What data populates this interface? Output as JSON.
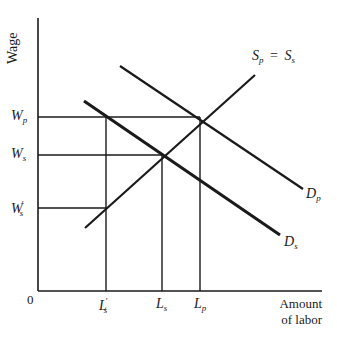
{
  "diagram": {
    "y_axis_label": "Wage",
    "x_axis_label_line1": "Amount",
    "x_axis_label_line2": "of labor",
    "origin_label": "0",
    "wage_levels": [
      {
        "main": "W",
        "sub": "p",
        "prime": ""
      },
      {
        "main": "W",
        "sub": "s",
        "prime": ""
      },
      {
        "main": "W",
        "sub": "s",
        "prime": "′"
      }
    ],
    "labor_levels": [
      {
        "main": "L",
        "sub": "s",
        "prime": "′"
      },
      {
        "main": "L",
        "sub": "s",
        "prime": ""
      },
      {
        "main": "L",
        "sub": "p",
        "prime": ""
      }
    ],
    "curves": {
      "supply": {
        "main1": "S",
        "sub1": "p",
        "eq": "=",
        "main2": "S",
        "sub2": "s"
      },
      "demand_p": {
        "main": "D",
        "sub": "p"
      },
      "demand_s": {
        "main": "D",
        "sub": "s"
      }
    }
  }
}
